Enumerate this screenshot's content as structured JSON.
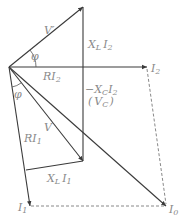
{
  "diagram": {
    "type": "phasor-diagram",
    "colors": {
      "line": "#3a3a3a",
      "label": "#8a8a8a",
      "dashed": "#7a7a7a"
    },
    "points": {
      "origin": [
        9,
        67
      ],
      "v_prime_tip": [
        83,
        7
      ],
      "i2_tip": [
        147,
        67
      ],
      "v_tip": [
        83,
        161
      ],
      "ri1_corner": [
        26,
        170
      ],
      "i1_tip": [
        30,
        206
      ],
      "i0_tip": [
        166,
        206
      ]
    },
    "labels": {
      "v_prime": {
        "main": "V",
        "prime": "′"
      },
      "phi_top": "φ",
      "xl_i2": {
        "x": "X",
        "xsub": "L",
        "i": "I",
        "isub": "2"
      },
      "ri2": {
        "r": "RI",
        "sub": "2"
      },
      "i2": {
        "i": "I",
        "sub": "2"
      },
      "neg_xc_i2": {
        "minus": "−X",
        "xsub": "C",
        "i": "I",
        "isub": "2"
      },
      "vc": {
        "open": "(",
        "v": "V",
        "sub": "C",
        "close": ")"
      },
      "phi_bottom": "φ",
      "v": "V",
      "ri1": {
        "r": "RI",
        "sub": "1"
      },
      "xl_i1": {
        "x": "X",
        "xsub": "L",
        "i": "I",
        "isub": "1"
      },
      "i1": {
        "i": "I",
        "sub": "1"
      },
      "i0": {
        "i": "I",
        "sub": "0"
      }
    }
  }
}
